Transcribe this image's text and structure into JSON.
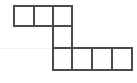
{
  "figure": {
    "kind": "polyomino-grid-figure",
    "canvas": {
      "width": 137,
      "height": 83,
      "background": "#ffffff"
    },
    "colors": {
      "stroke": "#4a4a4a",
      "cell_fill": "#ffffff",
      "faint_rule": "#f0f0f0"
    },
    "stroke_width": 2,
    "grid": {
      "origin_x": 14,
      "origin_y": 6,
      "cell_width": 20,
      "cell_height": 21,
      "columns": 6,
      "rows": 3
    },
    "cell_count": 8,
    "cells": [
      {
        "row": 0,
        "col": 0,
        "x": 14,
        "y": 6,
        "w": 20,
        "h": 20
      },
      {
        "row": 0,
        "col": 1,
        "x": 34,
        "y": 6,
        "w": 19,
        "h": 20
      },
      {
        "row": 0,
        "col": 2,
        "x": 53,
        "y": 6,
        "w": 19,
        "h": 20
      },
      {
        "row": 1,
        "col": 2,
        "x": 53,
        "y": 26,
        "w": 19,
        "h": 22
      },
      {
        "row": 2,
        "col": 2,
        "x": 53,
        "y": 48,
        "w": 19,
        "h": 22
      },
      {
        "row": 2,
        "col": 3,
        "x": 72,
        "y": 48,
        "w": 20,
        "h": 22
      },
      {
        "row": 2,
        "col": 4,
        "x": 92,
        "y": 48,
        "w": 20,
        "h": 22
      },
      {
        "row": 2,
        "col": 5,
        "x": 112,
        "y": 48,
        "w": 20,
        "h": 22
      }
    ],
    "row_labels": [
      "top-row",
      "middle-row",
      "bottom-row"
    ],
    "row_cell_counts": [
      3,
      1,
      4
    ],
    "faint_rule": {
      "x1": 0,
      "y1": 48,
      "x2": 53,
      "y2": 48
    }
  }
}
